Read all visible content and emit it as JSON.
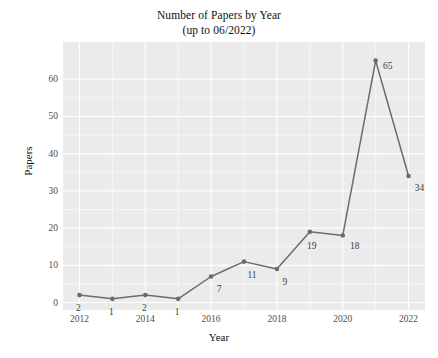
{
  "chart_data": {
    "type": "line",
    "title": "Number of Papers by Year",
    "subtitle": "(up to 06/2022)",
    "xlabel": "Year",
    "ylabel": "Papers",
    "x": [
      2012,
      2013,
      2014,
      2015,
      2016,
      2017,
      2018,
      2019,
      2020,
      2021,
      2022
    ],
    "values": [
      2,
      1,
      2,
      1,
      7,
      11,
      9,
      19,
      18,
      65,
      34
    ],
    "point_labels": [
      "2",
      "1",
      "2",
      "1",
      "7",
      "11",
      "9",
      "19",
      "18",
      "65",
      "34"
    ],
    "xticks": [
      "2012",
      "2014",
      "2016",
      "2018",
      "2020",
      "2022"
    ],
    "xtick_values": [
      2012,
      2014,
      2016,
      2018,
      2020,
      2022
    ],
    "yticks": [
      "0",
      "10",
      "20",
      "30",
      "40",
      "50",
      "60"
    ],
    "ytick_values": [
      0,
      10,
      20,
      30,
      40,
      50,
      60
    ],
    "xlim": [
      2011.5,
      2022.5
    ],
    "ylim": [
      -2,
      70
    ],
    "grid": true,
    "legend": "none",
    "series_color": "#6b6b6b",
    "panel_color": "#ebebeb",
    "gridline_color": "#ffffff",
    "background_color": "#ffffff",
    "label_color": "#3d3d3d",
    "tick_color": "#4d4d4d"
  }
}
